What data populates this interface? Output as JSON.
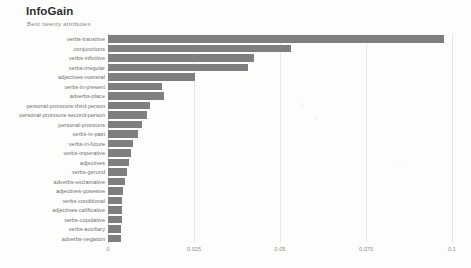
{
  "header": {
    "title": "InfoGain",
    "subtitle": "Best twenty attributes"
  },
  "chart_data": {
    "type": "bar",
    "orientation": "horizontal",
    "title": "InfoGain",
    "subtitle": "Best twenty attributes",
    "xlabel": "",
    "ylabel": "",
    "xlim": [
      0,
      0.1
    ],
    "grid": true,
    "legend": false,
    "bar_color": "#7f7f7f",
    "xticks": [
      "0",
      "0.025",
      "0.05",
      "0.075",
      "0.1"
    ],
    "xtick_values": [
      0,
      0.025,
      0.05,
      0.075,
      0.1
    ],
    "categories": [
      "verbs-transitive",
      "conjunctions",
      "verbs-infinitive",
      "verbs-irregular",
      "adjectives-numeral",
      "verbs-in-present",
      "adverbs-place",
      "personal-pronouns-third-person",
      "personal-pronouns-second-person",
      "personal-pronouns",
      "verbs-in-past",
      "verbs-in-future",
      "verbs-imperative",
      "adjectives",
      "verbs-gerund",
      "adverbs-exclamative",
      "adjectives-posesive",
      "verbs-conditional",
      "adjectives-calificative",
      "verbs-copulative",
      "verbs-auxiliary",
      "adverbs-negation"
    ],
    "values": [
      0.0978,
      0.0533,
      0.0425,
      0.0408,
      0.0252,
      0.0158,
      0.0163,
      0.0123,
      0.0113,
      0.01,
      0.0087,
      0.0072,
      0.0068,
      0.0062,
      0.0055,
      0.0048,
      0.0044,
      0.0042,
      0.0041,
      0.004,
      0.0039,
      0.0038
    ]
  }
}
